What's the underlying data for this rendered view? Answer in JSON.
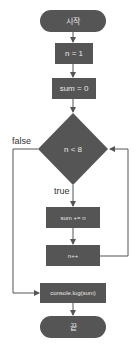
{
  "diagram": {
    "type": "flowchart",
    "colors": {
      "node_fill": "#555555",
      "node_text": "#e8e8e8",
      "edge": "#555555",
      "label": "#333333",
      "background": "#ffffff"
    },
    "nodes": {
      "start": {
        "shape": "terminal",
        "label": "시작"
      },
      "init_n": {
        "shape": "process",
        "label": "n = 1"
      },
      "init_sum": {
        "shape": "process",
        "label": "sum = 0"
      },
      "condition": {
        "shape": "decision",
        "label": "n < 8"
      },
      "add": {
        "shape": "process",
        "label": "sum += n"
      },
      "increment": {
        "shape": "process",
        "label": "n++"
      },
      "output": {
        "shape": "process",
        "label": "console.log(sum)"
      },
      "end": {
        "shape": "terminal",
        "label": "끝"
      }
    },
    "edges": [
      {
        "from": "start",
        "to": "init_n",
        "label": ""
      },
      {
        "from": "init_n",
        "to": "init_sum",
        "label": ""
      },
      {
        "from": "init_sum",
        "to": "condition",
        "label": ""
      },
      {
        "from": "condition",
        "to": "add",
        "label": "true"
      },
      {
        "from": "add",
        "to": "increment",
        "label": ""
      },
      {
        "from": "increment",
        "to": "condition",
        "label": ""
      },
      {
        "from": "condition",
        "to": "output",
        "label": "false"
      },
      {
        "from": "output",
        "to": "end",
        "label": ""
      }
    ],
    "edge_labels": {
      "true": "true",
      "false": "false"
    }
  }
}
